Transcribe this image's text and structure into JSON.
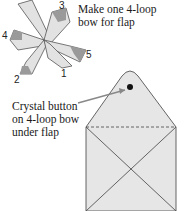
{
  "caption_top": {
    "line1": "Make one 4-loop",
    "line2": "bow for flap"
  },
  "caption_left": {
    "line1": "Crystal button",
    "line2": "on 4-loop bow",
    "line3": "under flap"
  },
  "loop_numbers": [
    "1",
    "2",
    "3",
    "4",
    "5"
  ],
  "colors": {
    "envelope_fill": "#e6e6e6",
    "ribbon_light": "#e2e2e2",
    "ribbon_dark": "#9a9a9a",
    "line": "#444444"
  }
}
